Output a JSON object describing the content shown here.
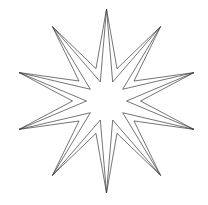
{
  "figure": {
    "title": "",
    "shape": "ten-pointed-star",
    "points": 10,
    "center": [
      106.5,
      101
    ],
    "tip_radius": 92,
    "start_angle_deg": -90,
    "outlines": [
      {
        "name": "outer-outline",
        "inner_radius": 34,
        "stroke": "#3a3a3a",
        "stroke_width": 0.7
      },
      {
        "name": "inner-outline",
        "inner_radius": 20,
        "stroke": "#3a3a3a",
        "stroke_width": 0.7
      }
    ],
    "fill": "#ffffff",
    "background": "#ffffff"
  }
}
